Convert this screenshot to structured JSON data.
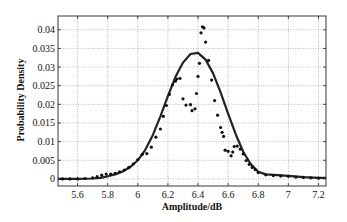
{
  "chart_data": {
    "type": "line",
    "title": "",
    "xlabel": "Amplitude/dB",
    "ylabel": "Probability Density",
    "xlim": [
      5.47,
      7.25
    ],
    "ylim": [
      -0.0019,
      0.0437
    ],
    "grid": true,
    "legend": null,
    "xticks": [
      5.6,
      5.8,
      6,
      6.2,
      6.4,
      6.6,
      6.8,
      7,
      7.2
    ],
    "xtick_labels": [
      "5.6",
      "5.8",
      "6",
      "6.2",
      "6.4",
      "6.6",
      "6.8",
      "7",
      "7.2"
    ],
    "yticks": [
      0,
      0.005,
      0.01,
      0.015,
      0.02,
      0.025,
      0.03,
      0.035,
      0.04
    ],
    "ytick_labels": [
      "0",
      "0.005",
      "0.01",
      "0.015",
      "0.02",
      "0.025",
      "0.03",
      "0.035",
      "0.04"
    ],
    "series": [
      {
        "name": "Fitted PDF",
        "style": "line",
        "color": "#222222",
        "x": [
          5.47,
          5.6,
          5.7,
          5.75,
          5.8,
          5.85,
          5.9,
          5.95,
          6.0,
          6.05,
          6.1,
          6.15,
          6.2,
          6.25,
          6.3,
          6.35,
          6.4,
          6.45,
          6.5,
          6.55,
          6.6,
          6.65,
          6.7,
          6.75,
          6.8,
          6.85,
          6.9,
          7.0,
          7.1,
          7.2,
          7.25
        ],
        "y": [
          0.0,
          0.0,
          0.0001,
          0.0003,
          0.0007,
          0.0012,
          0.002,
          0.0032,
          0.005,
          0.0078,
          0.0118,
          0.0168,
          0.0222,
          0.0273,
          0.0312,
          0.0335,
          0.0338,
          0.032,
          0.0283,
          0.0232,
          0.0175,
          0.012,
          0.0073,
          0.004,
          0.0019,
          0.0012,
          0.0011,
          0.0008,
          0.0005,
          0.0003,
          0.0003
        ]
      },
      {
        "name": "Measured data",
        "style": "scatter",
        "color": "#111111",
        "x": [
          5.5,
          5.55,
          5.6,
          5.65,
          5.7,
          5.73,
          5.76,
          5.79,
          5.82,
          5.85,
          5.88,
          5.91,
          5.94,
          5.97,
          6.0,
          6.03,
          6.06,
          6.09,
          6.12,
          6.15,
          6.17,
          6.19,
          6.21,
          6.23,
          6.25,
          6.26,
          6.28,
          6.3,
          6.32,
          6.35,
          6.36,
          6.38,
          6.39,
          6.4,
          6.41,
          6.42,
          6.43,
          6.44,
          6.45,
          6.47,
          6.49,
          6.51,
          6.53,
          6.55,
          6.56,
          6.57,
          6.58,
          6.6,
          6.62,
          6.63,
          6.64,
          6.66,
          6.68,
          6.7,
          6.72,
          6.74,
          6.76,
          6.78,
          6.8,
          6.85,
          6.9,
          6.95,
          7.0,
          7.05,
          7.1,
          7.15,
          7.2
        ],
        "y": [
          0.0,
          0.0,
          0.0,
          0.0001,
          0.0003,
          0.0006,
          0.001,
          0.0013,
          0.0013,
          0.0015,
          0.0019,
          0.0024,
          0.0031,
          0.004,
          0.0052,
          0.0066,
          0.0068,
          0.0085,
          0.0112,
          0.0134,
          0.0168,
          0.0197,
          0.0227,
          0.0252,
          0.0262,
          0.0268,
          0.027,
          0.0215,
          0.0198,
          0.0199,
          0.0183,
          0.0188,
          0.0229,
          0.0275,
          0.031,
          0.0392,
          0.0408,
          0.0405,
          0.0367,
          0.0318,
          0.0265,
          0.021,
          0.0171,
          0.0138,
          0.0125,
          0.0114,
          0.0077,
          0.0074,
          0.0062,
          0.0072,
          0.0087,
          0.0088,
          0.008,
          0.0067,
          0.0049,
          0.0039,
          0.0031,
          0.0025,
          0.0017,
          0.0011,
          0.0009,
          0.0008,
          0.0007,
          0.0005,
          0.0004,
          0.0003,
          0.0002
        ]
      }
    ]
  }
}
